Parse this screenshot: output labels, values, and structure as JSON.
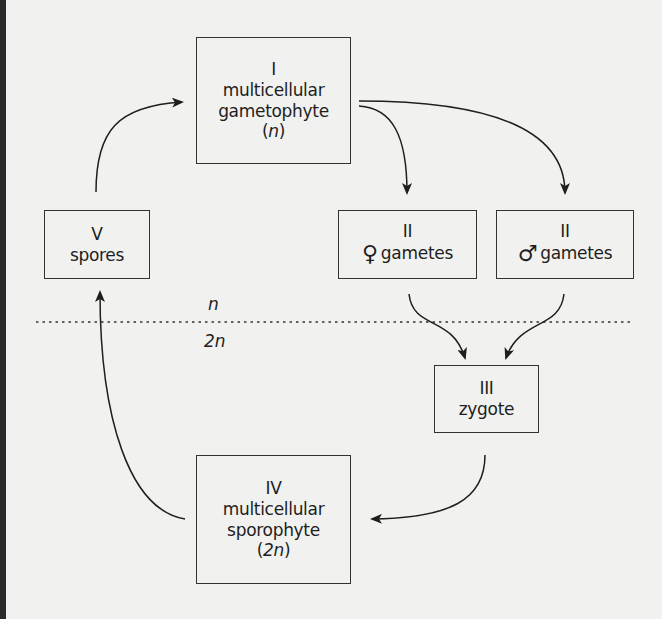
{
  "diagram": {
    "title": "",
    "ploidy_labels": {
      "haploid": "n",
      "diploid": "2n"
    },
    "nodes": [
      {
        "id": "I",
        "roman": "I",
        "lines": [
          "multicellular",
          "gametophyte"
        ],
        "ploidy_open": "(",
        "ploidy": "n",
        "ploidy_close": ")"
      },
      {
        "id": "II_f",
        "roman": "II",
        "symbol": "♀",
        "label": "gametes"
      },
      {
        "id": "II_m",
        "roman": "II",
        "symbol": "♂",
        "label": "gametes"
      },
      {
        "id": "III",
        "roman": "III",
        "label": "zygote"
      },
      {
        "id": "IV",
        "roman": "IV",
        "lines": [
          "multicellular",
          "sporophyte"
        ],
        "ploidy_open": "(",
        "ploidy": "2n",
        "ploidy_close": ")"
      },
      {
        "id": "V",
        "roman": "V",
        "label": "spores"
      }
    ],
    "edges": [
      {
        "from": "V",
        "to": "I"
      },
      {
        "from": "I",
        "to": "II_f"
      },
      {
        "from": "I",
        "to": "II_m"
      },
      {
        "from": "II_f",
        "to": "III"
      },
      {
        "from": "II_m",
        "to": "III"
      },
      {
        "from": "III",
        "to": "IV"
      },
      {
        "from": "IV",
        "to": "V"
      }
    ],
    "colors": {
      "background": "#f1f1ef",
      "ink": "#1e1e1e",
      "border": "#2a2a2a"
    }
  }
}
